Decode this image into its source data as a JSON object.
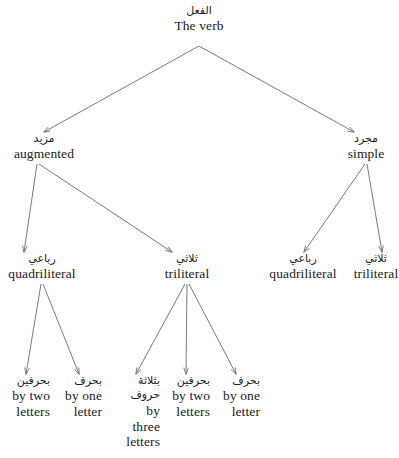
{
  "diagram": {
    "title": "The verb",
    "type": "tree",
    "background_color": "#ffffff",
    "line_color": "#6b6b6b",
    "text_color": "#1a1a1a"
  },
  "nodes": {
    "root": {
      "arabic": "الفعل",
      "english": "The verb"
    },
    "augmented": {
      "arabic": "مزيد",
      "english": "augmented"
    },
    "simple": {
      "arabic": "مجرد",
      "english": "simple"
    },
    "augmented_quadriliteral": {
      "arabic": "رباعي",
      "english": "quadriliteral"
    },
    "augmented_triliteral": {
      "arabic": "ثلاثي",
      "english": "triliteral"
    },
    "simple_quadriliteral": {
      "arabic": "رباعي",
      "english": "quadriliteral"
    },
    "simple_triliteral": {
      "arabic": "ثلاثي",
      "english": "triliteral"
    },
    "quad_by_two": {
      "arabic": "بحرفين",
      "english": "by two letters"
    },
    "quad_by_one": {
      "arabic": "بحرف",
      "english": "by one letter"
    },
    "tri_by_three": {
      "arabic": "بثلاثة حروف",
      "english": "by three letters"
    },
    "tri_by_two": {
      "arabic": "بحرفين",
      "english": "by two letters"
    },
    "tri_by_one": {
      "arabic": "بحرف",
      "english": "by one letter"
    }
  },
  "edges": [
    {
      "from": "root",
      "to": "augmented"
    },
    {
      "from": "root",
      "to": "simple"
    },
    {
      "from": "augmented",
      "to": "augmented_quadriliteral"
    },
    {
      "from": "augmented",
      "to": "augmented_triliteral"
    },
    {
      "from": "simple",
      "to": "simple_quadriliteral"
    },
    {
      "from": "simple",
      "to": "simple_triliteral"
    },
    {
      "from": "augmented_quadriliteral",
      "to": "quad_by_two"
    },
    {
      "from": "augmented_quadriliteral",
      "to": "quad_by_one"
    },
    {
      "from": "augmented_triliteral",
      "to": "tri_by_three"
    },
    {
      "from": "augmented_triliteral",
      "to": "tri_by_two"
    },
    {
      "from": "augmented_triliteral",
      "to": "tri_by_one"
    }
  ]
}
